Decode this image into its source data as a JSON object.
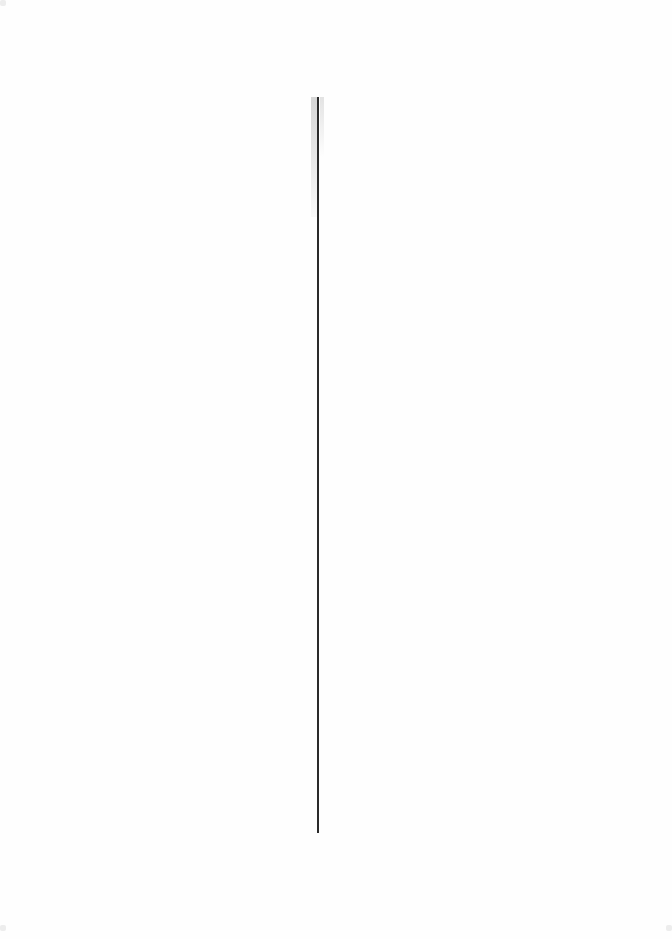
{
  "page": {
    "type": "scanned-blank-page",
    "text": "",
    "rule": {
      "orientation": "vertical",
      "color": "#2a2a2a",
      "x": 318,
      "y_start": 97,
      "y_end": 833
    },
    "background": "#fefefe"
  }
}
